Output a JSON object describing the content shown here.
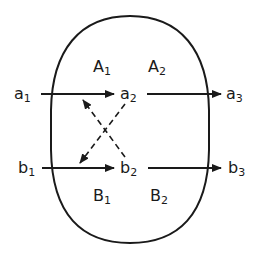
{
  "diagram": {
    "type": "node-flow-with-boundary",
    "boundary": {
      "shape": "rounded-oval",
      "stroke": "#1a1a1a"
    },
    "regions": {
      "A1": {
        "base": "A",
        "sub": "1"
      },
      "A2": {
        "base": "A",
        "sub": "2"
      },
      "B1": {
        "base": "B",
        "sub": "1"
      },
      "B2": {
        "base": "B",
        "sub": "2"
      }
    },
    "nodes": {
      "a1": {
        "base": "a",
        "sub": "1"
      },
      "a2": {
        "base": "a",
        "sub": "2"
      },
      "a3": {
        "base": "a",
        "sub": "3"
      },
      "b1": {
        "base": "b",
        "sub": "1"
      },
      "b2": {
        "base": "b",
        "sub": "2"
      },
      "b3": {
        "base": "b",
        "sub": "3"
      }
    },
    "edges": [
      {
        "from": "a1",
        "to": "a2",
        "style": "solid"
      },
      {
        "from": "a2",
        "to": "a3",
        "style": "solid"
      },
      {
        "from": "b1",
        "to": "b2",
        "style": "solid"
      },
      {
        "from": "b2",
        "to": "b3",
        "style": "solid"
      },
      {
        "from": "b2",
        "to": "a1-a2 edge",
        "style": "dashed"
      },
      {
        "from": "a2",
        "to": "b1-b2 edge",
        "style": "dashed"
      }
    ],
    "colors": {
      "ink": "#1a1a1a",
      "background": "#ffffff"
    }
  }
}
